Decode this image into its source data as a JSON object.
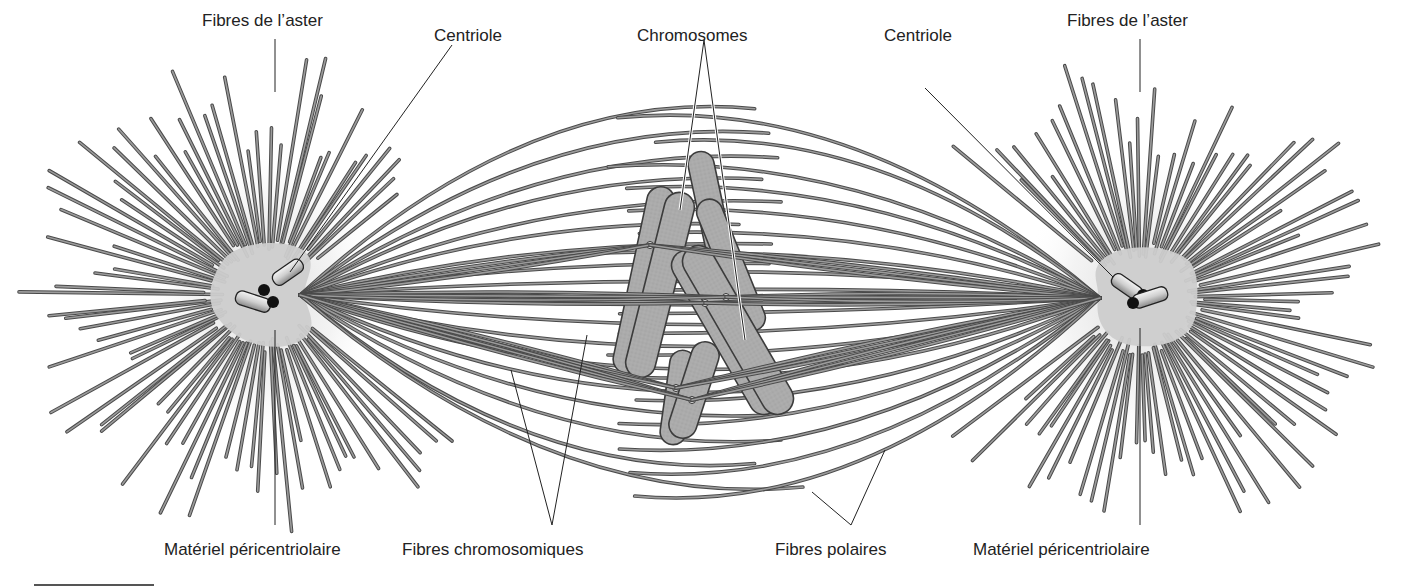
{
  "diagram": {
    "labels": {
      "aster_left": "Fibres de l’aster",
      "aster_right": "Fibres de l’aster",
      "centriole_left": "Centriole",
      "centriole_right": "Centriole",
      "chromosomes": "Chromosomes",
      "pcm_left": "Matériel péricentriolaire",
      "pcm_right": "Matériel péricentriolaire",
      "chromosomal_fibers": "Fibres chromosomiques",
      "polar_fibers": "Fibres polaires"
    },
    "colors": {
      "fiber": "#7a7a7a",
      "fiber_edge": "#4a4a4a",
      "chromosome_fill": "#a9a9a9",
      "chromosome_edge": "#3c3c3c",
      "pcm": "#cfcfcf",
      "leader_line": "#222222"
    }
  }
}
